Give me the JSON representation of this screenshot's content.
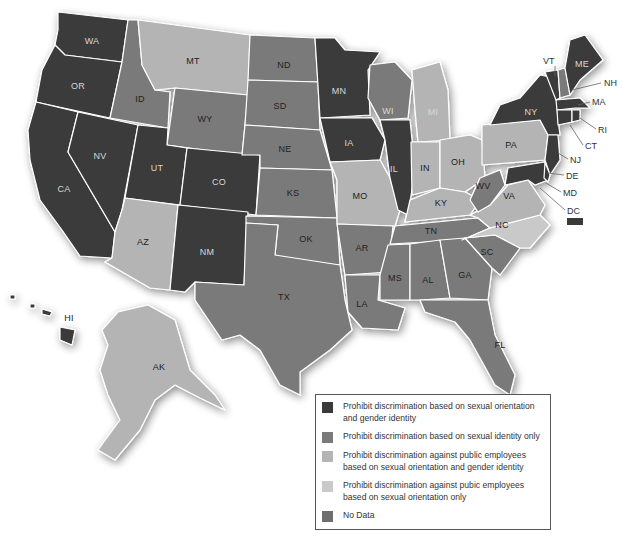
{
  "colors": {
    "full_protection": "#3a3a3a",
    "sexual_orientation_only": "#7a7a7a",
    "public_emp_so_gi": "#b4b4b4",
    "public_emp_so_only": "#c9c9c9",
    "no_data": "#6e6e6e",
    "border": "#ffffff"
  },
  "legend": {
    "items": [
      {
        "key": "full_protection",
        "label": "Prohibit discrimination based on sexual orientation and gender identity"
      },
      {
        "key": "sexual_orientation_only",
        "label": "Prohibit discrimination based on sexual identity only"
      },
      {
        "key": "public_emp_so_gi",
        "label": "Prohibit discrimination against public employees based on sexual orientation and gender identity"
      },
      {
        "key": "public_emp_so_only",
        "label": "Prohibit discrimination against pubic employees based on sexual orientation only"
      },
      {
        "key": "no_data",
        "label": "No Data"
      }
    ]
  },
  "states": {
    "WA": {
      "label": "WA",
      "category": "full_protection"
    },
    "OR": {
      "label": "OR",
      "category": "full_protection"
    },
    "CA": {
      "label": "CA",
      "category": "full_protection"
    },
    "NV": {
      "label": "NV",
      "category": "full_protection"
    },
    "ID": {
      "label": "ID",
      "category": "sexual_orientation_only"
    },
    "MT": {
      "label": "MT",
      "category": "public_emp_so_gi"
    },
    "WY": {
      "label": "WY",
      "category": "sexual_orientation_only"
    },
    "UT": {
      "label": "UT",
      "category": "full_protection"
    },
    "CO": {
      "label": "CO",
      "category": "full_protection"
    },
    "AZ": {
      "label": "AZ",
      "category": "public_emp_so_gi"
    },
    "NM": {
      "label": "NM",
      "category": "full_protection"
    },
    "ND": {
      "label": "ND",
      "category": "sexual_orientation_only"
    },
    "SD": {
      "label": "SD",
      "category": "sexual_orientation_only"
    },
    "NE": {
      "label": "NE",
      "category": "sexual_orientation_only"
    },
    "KS": {
      "label": "KS",
      "category": "sexual_orientation_only"
    },
    "OK": {
      "label": "OK",
      "category": "sexual_orientation_only"
    },
    "TX": {
      "label": "TX",
      "category": "sexual_orientation_only"
    },
    "MN": {
      "label": "MN",
      "category": "full_protection"
    },
    "IA": {
      "label": "IA",
      "category": "full_protection"
    },
    "MO": {
      "label": "MO",
      "category": "public_emp_so_gi"
    },
    "AR": {
      "label": "AR",
      "category": "sexual_orientation_only"
    },
    "LA": {
      "label": "LA",
      "category": "sexual_orientation_only"
    },
    "WI": {
      "label": "WI",
      "category": "sexual_orientation_only"
    },
    "IL": {
      "label": "IL",
      "category": "full_protection"
    },
    "MI": {
      "label": "MI",
      "category": "public_emp_so_gi"
    },
    "IN": {
      "label": "IN",
      "category": "public_emp_so_gi"
    },
    "OH": {
      "label": "OH",
      "category": "public_emp_so_gi"
    },
    "KY": {
      "label": "KY",
      "category": "public_emp_so_gi"
    },
    "TN": {
      "label": "TN",
      "category": "sexual_orientation_only"
    },
    "MS": {
      "label": "MS",
      "category": "sexual_orientation_only"
    },
    "AL": {
      "label": "AL",
      "category": "sexual_orientation_only"
    },
    "GA": {
      "label": "GA",
      "category": "sexual_orientation_only"
    },
    "FL": {
      "label": "FL",
      "category": "sexual_orientation_only"
    },
    "SC": {
      "label": "SC",
      "category": "sexual_orientation_only"
    },
    "NC": {
      "label": "NC",
      "category": "public_emp_so_only"
    },
    "VA": {
      "label": "VA",
      "category": "public_emp_so_gi"
    },
    "WV": {
      "label": "WV",
      "category": "sexual_orientation_only"
    },
    "PA": {
      "label": "PA",
      "category": "public_emp_so_gi"
    },
    "NY": {
      "label": "NY",
      "category": "full_protection"
    },
    "VT": {
      "label": "VT",
      "category": "full_protection"
    },
    "NH": {
      "label": "NH",
      "category": "sexual_orientation_only"
    },
    "ME": {
      "label": "ME",
      "category": "full_protection"
    },
    "MA": {
      "label": "MA",
      "category": "full_protection"
    },
    "RI": {
      "label": "RI",
      "category": "full_protection"
    },
    "CT": {
      "label": "CT",
      "category": "full_protection"
    },
    "NJ": {
      "label": "NJ",
      "category": "full_protection"
    },
    "DE": {
      "label": "DE",
      "category": "full_protection"
    },
    "MD": {
      "label": "MD",
      "category": "full_protection"
    },
    "DC": {
      "label": "DC",
      "category": "full_protection"
    },
    "HI": {
      "label": "HI",
      "category": "full_protection"
    },
    "AK": {
      "label": "AK",
      "category": "public_emp_so_gi"
    }
  }
}
